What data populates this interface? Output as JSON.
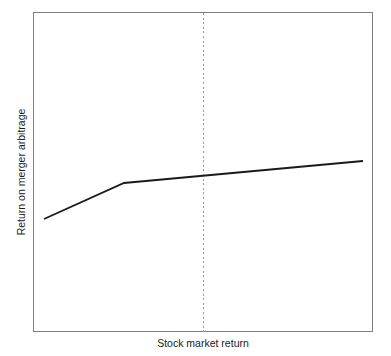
{
  "chart_data": {
    "type": "line",
    "title": "",
    "subtitle": "",
    "xlabel": "Stock market return",
    "ylabel": "Return on merger arbitrage",
    "grid": false,
    "legend": null,
    "legend_position": "none",
    "axis_ticks": {
      "x": [],
      "y": []
    },
    "xlim": [
      0,
      1
    ],
    "ylim": [
      0,
      1
    ],
    "series": [
      {
        "name": "Return on merger arbitrage",
        "color": "#1a1a1a",
        "line_width": 1.8,
        "line_style": "solid",
        "x": [
          0.032,
          0.268,
          0.968
        ],
        "y": [
          0.353,
          0.466,
          0.534
        ],
        "points_px": [
          {
            "x": 44,
            "y": 219
          },
          {
            "x": 124,
            "y": 183
          },
          {
            "x": 363,
            "y": 161
          }
        ]
      }
    ],
    "annotations": [
      {
        "name": "zero-market-return-reference",
        "type": "vertical-line",
        "x": 0.5,
        "x_px": 203.5,
        "style": "dotted",
        "color": "#999999",
        "line_width": 1,
        "label": ""
      }
    ],
    "frame": {
      "x_px": 33,
      "y_px": 12,
      "width_px": 340,
      "height_px": 320,
      "border_color": "#808080",
      "border_width": 1,
      "background": "#ffffff"
    }
  },
  "figure": {
    "background": "#ffffff",
    "width": 391,
    "height": 356
  }
}
